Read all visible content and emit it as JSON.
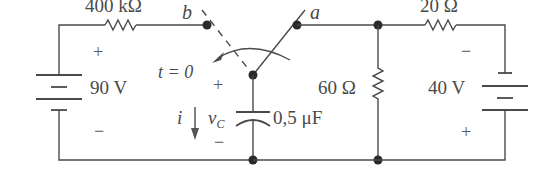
{
  "circuit": {
    "components": {
      "r_left": {
        "label": "400 kΩ"
      },
      "r_right_top": {
        "label": "20 Ω"
      },
      "r_mid": {
        "label": "60 Ω"
      },
      "source_left": {
        "label": "90 V",
        "plus": "+",
        "minus": "−"
      },
      "source_right": {
        "label": "40 V",
        "plus": "+",
        "minus": "−"
      },
      "capacitor": {
        "label": "0,5 μF",
        "voltage_symbol": "v",
        "voltage_subscript": "C",
        "plus": "+",
        "minus": "−"
      }
    },
    "switch": {
      "node_a": "a",
      "node_b": "b",
      "time_label": "t = 0"
    },
    "current": {
      "symbol": "i"
    }
  }
}
